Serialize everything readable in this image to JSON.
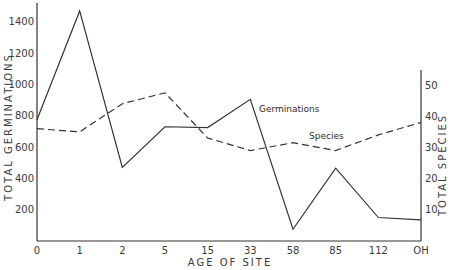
{
  "chart_data": {
    "type": "line",
    "title": "",
    "xlabel": "AGE OF SITE",
    "ylabel": "TOTAL GERMINATIONS",
    "y2label": "TOTAL SPECIES",
    "categories": [
      "0",
      "1",
      "2",
      "5",
      "15",
      "33",
      "58",
      "85",
      "112",
      "OH"
    ],
    "series": [
      {
        "name": "Germinations",
        "axis": "left",
        "style": "solid",
        "values": [
          775,
          1470,
          470,
          730,
          725,
          905,
          75,
          465,
          150,
          135
        ]
      },
      {
        "name": "Species",
        "axis": "right",
        "style": "dashed",
        "values": [
          36,
          35,
          44,
          47.5,
          33,
          29,
          31.5,
          29,
          34,
          38
        ]
      }
    ],
    "ylim": [
      0,
      1500
    ],
    "y_ticks": [
      200,
      400,
      600,
      800,
      1000,
      1200,
      1400
    ],
    "y2lim": [
      0,
      55
    ],
    "y2_ticks": [
      10,
      20,
      30,
      40,
      50
    ],
    "grid": false,
    "legend": "inline annotations",
    "annotations": [
      {
        "text": "Germinations",
        "near": "33"
      },
      {
        "text": "Species",
        "near": "58-85"
      }
    ]
  }
}
